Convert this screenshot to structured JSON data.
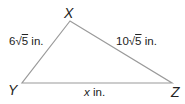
{
  "diagram": {
    "type": "triangle",
    "stroke_color": "#9a9a9a",
    "vertices": {
      "X": {
        "label": "X",
        "x": 70,
        "y": 21
      },
      "Y": {
        "label": "Y",
        "x": 22,
        "y": 83
      },
      "Z": {
        "label": "Z",
        "x": 172,
        "y": 83
      }
    },
    "sides": {
      "XY": {
        "coef": "6",
        "radical_symbol": "√",
        "radicand": "5",
        "unit": " in."
      },
      "XZ": {
        "coef": "10",
        "radical_symbol": "√",
        "radicand": "5",
        "unit": " in."
      },
      "YZ": {
        "variable": "x",
        "unit": " in."
      }
    }
  }
}
